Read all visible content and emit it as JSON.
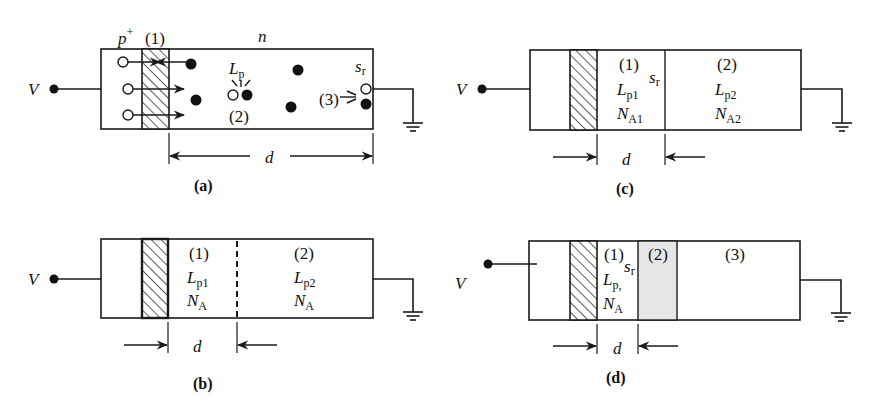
{
  "figure": {
    "colors": {
      "ink": "#1a1a1a",
      "background": "#ffffff",
      "stipple": "#e6e6e6"
    }
  },
  "panels": {
    "a": {
      "caption": "(a)",
      "terminal_label": "V",
      "p_plus_label": "p",
      "p_plus_sup": "+",
      "region1_label": "(1)",
      "n_label": "n",
      "diffusion_label": "L",
      "diffusion_sub": "p",
      "region2_label": "(2)",
      "surface_label": "s",
      "surface_sub": "r",
      "region3_label": "(3)",
      "dimension_label": "d",
      "box": {
        "x": 101,
        "y": 49,
        "w": 272,
        "h": 80
      },
      "hatch": {
        "x": 142,
        "w": 27
      },
      "terminal_dot": {
        "x": 54,
        "y": 89
      },
      "ground": {
        "wire_y": 89,
        "x": 413,
        "bottom": 123
      },
      "holes": [
        {
          "x": 123,
          "y": 62
        },
        {
          "x": 128,
          "y": 89
        },
        {
          "x": 128,
          "y": 115
        },
        {
          "x": 233,
          "y": 95
        },
        {
          "x": 366,
          "y": 89
        }
      ],
      "electrons": [
        {
          "x": 191,
          "y": 64
        },
        {
          "x": 196,
          "y": 100
        },
        {
          "x": 247,
          "y": 95
        },
        {
          "x": 298,
          "y": 70
        },
        {
          "x": 291,
          "y": 107
        },
        {
          "x": 366,
          "y": 104
        }
      ],
      "dimension": {
        "y": 156,
        "x1": 169,
        "x2": 373
      }
    },
    "b": {
      "caption": "(b)",
      "terminal_label": "V",
      "region1_label": "(1)",
      "region1_L": "L",
      "region1_L_sub": "p1",
      "region1_N": "N",
      "region1_N_sub": "A",
      "region2_label": "(2)",
      "region2_L": "L",
      "region2_L_sub": "p2",
      "region2_N": "N",
      "region2_N_sub": "A",
      "dimension_label": "d",
      "box": {
        "x": 101,
        "y": 239,
        "w": 272,
        "h": 79
      },
      "hatch": {
        "x": 142,
        "w": 26
      },
      "dashed_x": 237,
      "terminal_dot": {
        "x": 54,
        "y": 279
      },
      "ground": {
        "wire_y": 279,
        "x": 413,
        "bottom": 312
      },
      "dimension": {
        "y": 345,
        "x1": 168,
        "x2": 237
      }
    },
    "c": {
      "caption": "(c)",
      "terminal_label": "V",
      "region1_label": "(1)",
      "region1_L": "L",
      "region1_L_sub": "p1",
      "region1_N": "N",
      "region1_N_sub": "A1",
      "surface_label": "s",
      "surface_sub": "r",
      "region2_label": "(2)",
      "region2_L": "L",
      "region2_L_sub": "p2",
      "region2_N": "N",
      "region2_N_sub": "A2",
      "dimension_label": "d",
      "box": {
        "x": 530,
        "y": 50,
        "w": 271,
        "h": 80
      },
      "hatch": {
        "x": 570,
        "w": 27
      },
      "divider_x": 665,
      "terminal_dot": {
        "x": 482,
        "y": 89
      },
      "ground": {
        "wire_y": 89,
        "x": 842,
        "bottom": 123
      },
      "dimension": {
        "y": 157,
        "x1": 597,
        "x2": 665
      }
    },
    "d": {
      "caption": "(d)",
      "terminal_label": "V",
      "region1_label": "(1)",
      "surface_label": "s",
      "surface_sub": "r",
      "region1_L": "L",
      "region1_L_sub": "p,",
      "region1_N": "N",
      "region1_N_sub": "A",
      "region2_label": "(2)",
      "region3_label": "(3)",
      "dimension_label": "d",
      "box": {
        "x": 529,
        "y": 241,
        "w": 271,
        "h": 79
      },
      "hatch": {
        "x": 570,
        "w": 27
      },
      "stipple": {
        "x": 638,
        "w": 39
      },
      "terminal_dot": {
        "x": 488,
        "y": 264
      },
      "ground": {
        "wire_y": 280,
        "x": 841,
        "bottom": 313
      },
      "dimension": {
        "y": 346,
        "x1": 597,
        "x2": 638
      }
    }
  }
}
